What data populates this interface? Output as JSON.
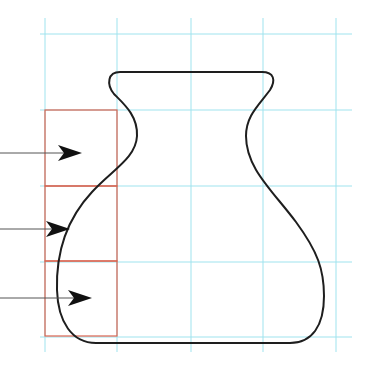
{
  "figure": {
    "colors": {
      "background": "#ffffff",
      "grid": "#9fe3ee",
      "boxes": "#d9634f",
      "outline": "#1e1e1e",
      "arrows": "#111111",
      "arrow_lines": "#555555"
    },
    "grid": {
      "vertical_x": [
        45,
        117,
        191,
        263,
        336
      ],
      "horizontal_y": [
        34,
        110,
        186,
        262,
        337
      ],
      "x_extent": [
        40,
        352
      ],
      "y_extent": [
        18,
        352
      ]
    },
    "boxes": [
      {
        "x": 45,
        "y": 110,
        "w": 72,
        "h": 76
      },
      {
        "x": 45,
        "y": 186,
        "w": 72,
        "h": 75
      },
      {
        "x": 45,
        "y": 261,
        "w": 72,
        "h": 75
      }
    ],
    "arrows": [
      {
        "y": 153,
        "x_start": 0,
        "tip_x": 82
      },
      {
        "y": 229,
        "x_start": 0,
        "tip_x": 70
      },
      {
        "y": 298,
        "x_start": 0,
        "tip_x": 92
      }
    ],
    "vase_path": "M 120 72 L 262 72 C 274 72 276 80 270 90 C 258 106 246 116 246 136 C 246 168 272 190 296 222 C 318 252 324 270 324 296 C 324 326 312 343 290 343 L 96 343 C 72 343 58 322 57 290 C 56 256 64 222 92 192 C 112 170 136 158 137 136 C 138 116 124 104 114 94 C 106 84 108 72 120 72 Z"
  }
}
